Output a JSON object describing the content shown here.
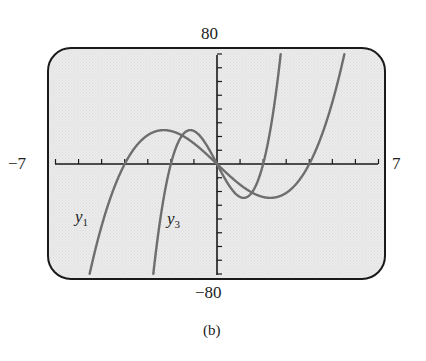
{
  "figure": {
    "caption": "(b)"
  },
  "window": {
    "xmin_label": "−7",
    "xmax_label": "7",
    "ymin_label": "−80",
    "ymax_label": "80"
  },
  "curves": {
    "y1": {
      "name": "y",
      "subscript": "1"
    },
    "y3": {
      "name": "y",
      "subscript": "3"
    }
  },
  "chart_data": {
    "type": "line",
    "title": "",
    "caption": "(b)",
    "xlabel": "",
    "ylabel": "",
    "xlim": [
      -7,
      7
    ],
    "ylim": [
      -80,
      80
    ],
    "xscale_ticks": 1,
    "yscale_ticks": 10,
    "grid": false,
    "legend": "inline labels",
    "series": [
      {
        "name": "y1",
        "formula": "x^3 - 16x",
        "coefficients": {
          "a3": 1,
          "a1": -16
        },
        "zeros": [
          -4,
          0,
          4
        ],
        "local_max": [
          -2.31,
          24.63
        ],
        "local_min": [
          2.31,
          -24.63
        ],
        "color": "#6e6e6e"
      },
      {
        "name": "y3",
        "formula": "8x^3 - 32x",
        "coefficients": {
          "a3": 8,
          "a1": -32
        },
        "zeros": [
          -2,
          0,
          2
        ],
        "local_max": [
          -1.15,
          24.63
        ],
        "local_min": [
          1.15,
          -24.63
        ],
        "color": "#6e6e6e"
      }
    ]
  },
  "colors": {
    "curve": "#6e6e6e",
    "axis": "#1a1a1a",
    "screen_border": "#1a1a1a",
    "screen_bg": "#ececec"
  }
}
